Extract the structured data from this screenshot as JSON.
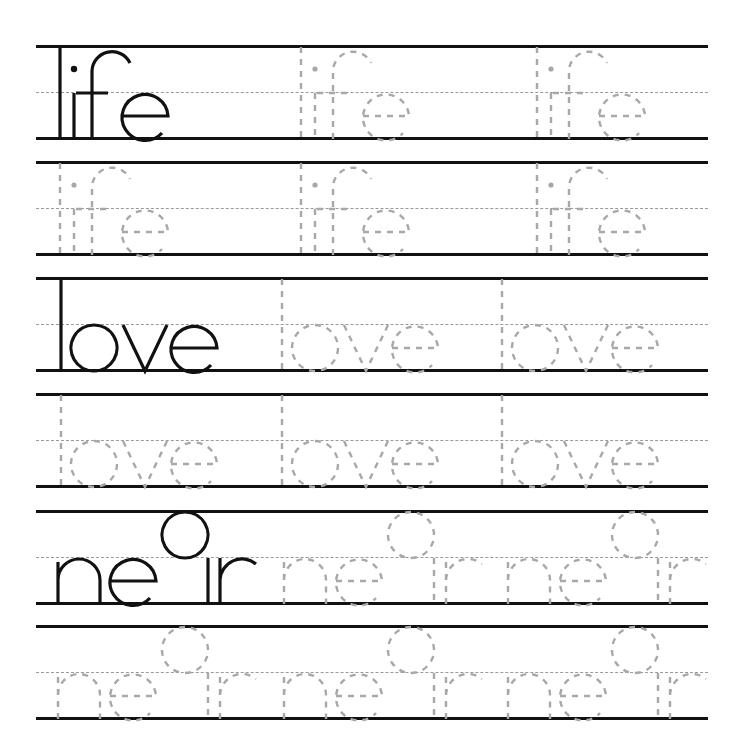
{
  "worksheet": {
    "title": "Handwriting tracing worksheet",
    "colors": {
      "rule_line": "#111111",
      "midline": "#9a9a9a",
      "model_letter": "#111111",
      "trace_letter": "#a8a8a8",
      "background": "#ffffff"
    },
    "words": [
      {
        "word": "life",
        "rows": [
          {
            "kind": "model+trace",
            "copies": [
              {
                "text": "life",
                "style": "solid"
              },
              {
                "text": "life",
                "style": "dashed"
              },
              {
                "text": "life",
                "style": "dashed"
              }
            ]
          },
          {
            "kind": "trace",
            "copies": [
              {
                "text": "life",
                "style": "dashed"
              },
              {
                "text": "life",
                "style": "dashed"
              },
              {
                "text": "life",
                "style": "dashed"
              }
            ]
          }
        ]
      },
      {
        "word": "love",
        "rows": [
          {
            "kind": "model+trace",
            "copies": [
              {
                "text": "love",
                "style": "solid"
              },
              {
                "text": "love",
                "style": "dashed"
              },
              {
                "text": "love",
                "style": "dashed"
              }
            ]
          },
          {
            "kind": "trace",
            "copies": [
              {
                "text": "love",
                "style": "dashed"
              },
              {
                "text": "love",
                "style": "dashed"
              },
              {
                "text": "love",
                "style": "dashed"
              }
            ]
          }
        ]
      },
      {
        "word": "near",
        "rows": [
          {
            "kind": "model+trace",
            "copies": [
              {
                "text": "near",
                "style": "solid"
              },
              {
                "text": "near",
                "style": "dashed"
              },
              {
                "text": "near",
                "style": "dashed"
              }
            ]
          },
          {
            "kind": "trace",
            "copies": [
              {
                "text": "near",
                "style": "dashed"
              },
              {
                "text": "near",
                "style": "dashed"
              },
              {
                "text": "near",
                "style": "dashed"
              }
            ]
          }
        ]
      }
    ]
  }
}
